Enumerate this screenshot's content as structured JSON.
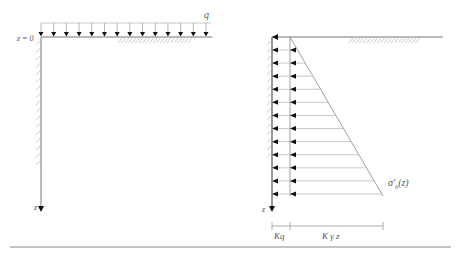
{
  "left_panel": {
    "load_label": "q",
    "surface_label": "z = 0",
    "depth_axis_label": "z",
    "load_arrow_count": 14
  },
  "right_panel": {
    "depth_axis_label": "z",
    "stress_label_main": "σ′",
    "stress_label_sub": "h",
    "stress_label_arg": "(z)",
    "dim_kq_label": "Kq",
    "dim_kgz_label": "K γ z",
    "pressure_arrow_count": 12
  },
  "colors": {
    "line": "#777777",
    "light_line": "#bbbbbb",
    "arrow": "#111111",
    "hatch": "#aaaaaa"
  }
}
